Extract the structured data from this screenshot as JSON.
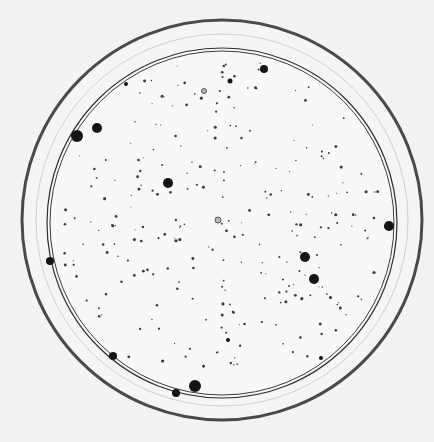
{
  "image": {
    "subject": "petri dish with bacterial colonies",
    "background": "#f2f2f2",
    "outer_rim": {
      "cx": 222,
      "cy": 220,
      "r": 200,
      "stroke": "#4a4a4a",
      "width": 3
    },
    "outer_rim_faint": {
      "cx": 222,
      "cy": 220,
      "r": 186,
      "stroke": "#cfcfcf",
      "width": 1
    },
    "inner_wall": {
      "cx": 222,
      "cy": 223,
      "r": 175,
      "stroke": "#2e2e2e",
      "width": 1.2
    },
    "inner_wall2": {
      "cx": 222,
      "cy": 223,
      "r": 172,
      "stroke": "#3a3a3a",
      "width": 1
    },
    "large_colonies": [
      {
        "x": 77,
        "y": 136,
        "r": 6
      },
      {
        "x": 97,
        "y": 128,
        "r": 5
      },
      {
        "x": 168,
        "y": 183,
        "r": 5
      },
      {
        "x": 264,
        "y": 69,
        "r": 4
      },
      {
        "x": 389,
        "y": 226,
        "r": 5
      },
      {
        "x": 305,
        "y": 257,
        "r": 5
      },
      {
        "x": 314,
        "y": 279,
        "r": 5
      },
      {
        "x": 50,
        "y": 261,
        "r": 4
      },
      {
        "x": 113,
        "y": 356,
        "r": 4
      },
      {
        "x": 195,
        "y": 386,
        "r": 6
      },
      {
        "x": 176,
        "y": 393,
        "r": 4
      },
      {
        "x": 230,
        "y": 81,
        "r": 2.5
      },
      {
        "x": 126,
        "y": 84,
        "r": 2
      },
      {
        "x": 321,
        "y": 358,
        "r": 2
      },
      {
        "x": 228,
        "y": 340,
        "r": 2
      }
    ],
    "ring_colonies": [
      {
        "x": 204,
        "y": 91,
        "r": 2.5
      },
      {
        "x": 218,
        "y": 220,
        "r": 3
      }
    ]
  }
}
